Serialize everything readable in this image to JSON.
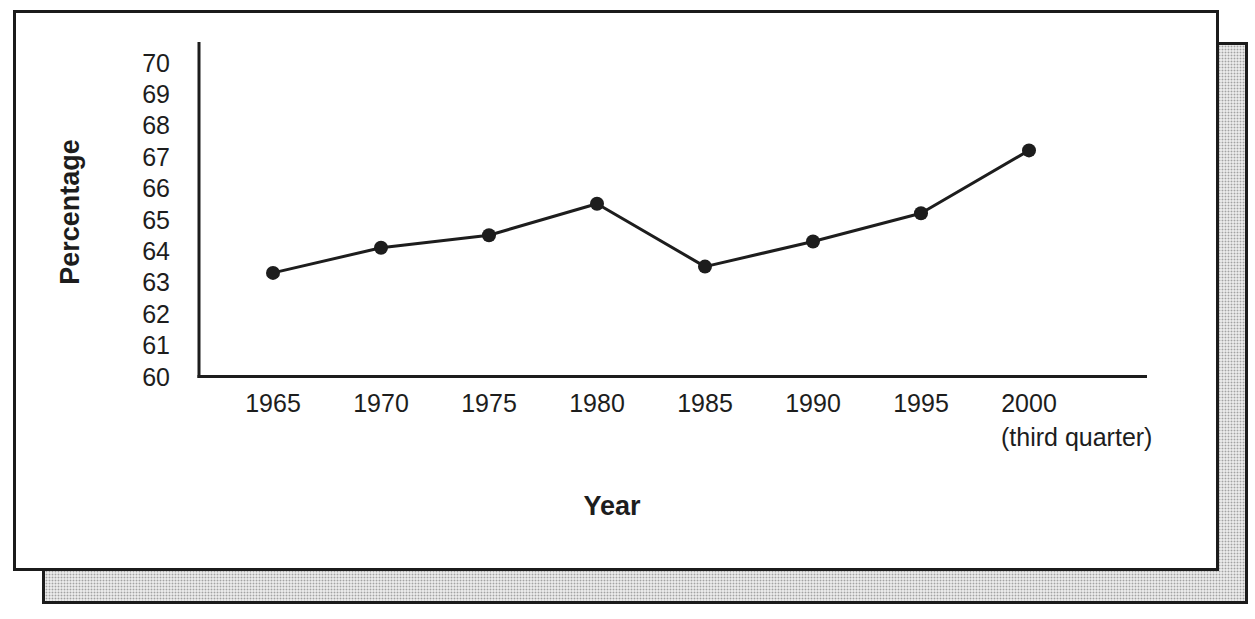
{
  "page": {
    "background": "#ffffff"
  },
  "cards": {
    "front_card": {
      "fill": "#ffffff",
      "border_color": "#1b1b1b"
    },
    "shadow_card": {
      "fill": "#d9d9d9",
      "border_color": "#1b1b1b"
    }
  },
  "chart_data": {
    "type": "line",
    "title": "",
    "xlabel": "Year",
    "ylabel": "Percentage",
    "categories": [
      "1965",
      "1970",
      "1975",
      "1980",
      "1985",
      "1990",
      "1995",
      "2000"
    ],
    "x_note": {
      "category_index": 7,
      "text": "(third quarter)"
    },
    "values": [
      63.3,
      64.1,
      64.5,
      65.5,
      63.5,
      64.3,
      65.2,
      67.2
    ],
    "ylim": [
      60,
      70
    ],
    "yticks": [
      60,
      61,
      62,
      63,
      64,
      65,
      66,
      67,
      68,
      69,
      70
    ],
    "grid": false,
    "legend_position": "none",
    "line_color": "#1d1d1d",
    "marker": "filled-circle",
    "marker_radius": 7
  }
}
